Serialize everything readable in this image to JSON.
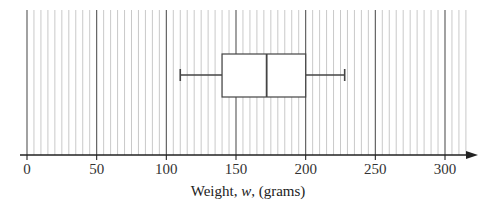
{
  "chart_data": {
    "type": "boxplot",
    "title": "",
    "xlabel": "Weight, w, (grams)",
    "xlabel_parts": {
      "prefix": "Weight, ",
      "var": "w",
      "suffix": ", (grams)"
    },
    "ylabel": "",
    "xlim": [
      0,
      315
    ],
    "x_ticks": [
      0,
      50,
      100,
      150,
      200,
      250,
      300
    ],
    "x_tick_labels": [
      "0",
      "50",
      "100",
      "150",
      "200",
      "250",
      "300"
    ],
    "minor_grid_step": 5,
    "major_grid_step": 50,
    "grid": true,
    "box": {
      "min": 110,
      "q1": 140,
      "median": 172,
      "q3": 200,
      "max": 228
    }
  },
  "colors": {
    "major_grid": "#555555",
    "minor_grid": "#bbbbbb",
    "axis": "#222222",
    "box_stroke": "#444444",
    "box_fill": "#ffffff"
  }
}
